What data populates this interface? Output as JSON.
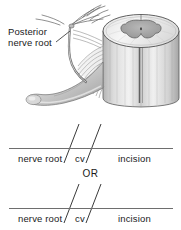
{
  "figure": {
    "background_color": "#ffffff",
    "text_color": "#1a1a1a",
    "rule_color": "#6e6e6e"
  },
  "illustration": {
    "name": "spinal-cord-posterior-nerve-root",
    "description": "Grayscale anatomical drawing of a spinal cord segment shown in cross-section with butterfly-shaped gray matter, and the posterior nerve root with its rootlets fanning out to the left",
    "palette": {
      "outline": "#4a4a4a",
      "cord_light": "#ededed",
      "cord_mid": "#c9c9c9",
      "cord_shadow": "#9a9a9a",
      "gray_matter": "#a6a6a6",
      "rootlet": "#8a8a8a",
      "nerve_body": "#d5d5d5"
    }
  },
  "callout": {
    "name": "posterior-nerve-root-callout",
    "line1": "Posterior",
    "line2": "nerve root",
    "leader_color": "#3a3a3a"
  },
  "annotations": {
    "or_label": "OR",
    "groups": [
      {
        "id": "annotation-row-1",
        "terms": [
          "nerve root",
          "cv",
          "incision"
        ],
        "separator": "/"
      },
      {
        "id": "annotation-row-2",
        "terms": [
          "nerve root",
          "cv",
          "incision"
        ],
        "separator": "/"
      }
    ]
  }
}
